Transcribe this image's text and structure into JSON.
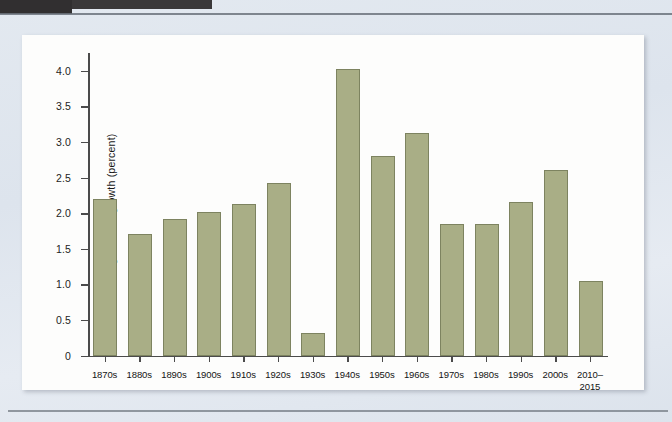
{
  "figure": {
    "background_color": "#e1e7ef",
    "card_color": "#fdfdfc",
    "bar_color": "#a9ae86",
    "bar_edge_color": "#7d8360",
    "axis_color": "#4b4b4b"
  },
  "chart_data": {
    "type": "bar",
    "title": "",
    "subtitle": "",
    "xlabel": "",
    "ylabel": "Average annual growth (percent)",
    "ylim": [
      0,
      4.25
    ],
    "ytick_labels": [
      "0",
      "0.5",
      "1.0",
      "1.5",
      "2.0",
      "2.5",
      "3.0",
      "3.5",
      "4.0"
    ],
    "ytick_values": [
      0,
      0.5,
      1.0,
      1.5,
      2.0,
      2.5,
      3.0,
      3.5,
      4.0
    ],
    "grid": false,
    "legend": false,
    "legend_position": "none",
    "categories": [
      "1870s",
      "1880s",
      "1890s",
      "1900s",
      "1910s",
      "1920s",
      "1930s",
      "1940s",
      "1950s",
      "1960s",
      "1970s",
      "1980s",
      "1990s",
      "2000s",
      "2010–\n2015"
    ],
    "values": [
      2.2,
      1.71,
      1.92,
      2.02,
      2.13,
      2.42,
      0.32,
      4.03,
      2.8,
      3.12,
      1.85,
      1.85,
      2.15,
      2.6,
      1.05
    ]
  }
}
